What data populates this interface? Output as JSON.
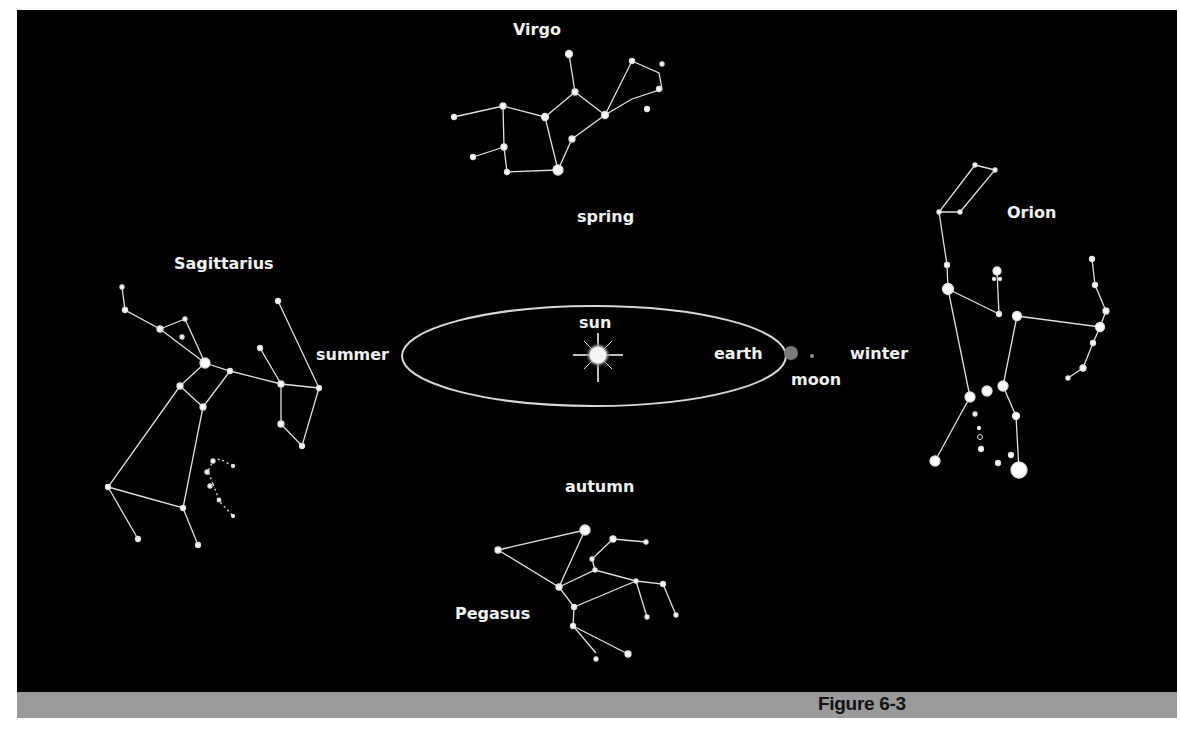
{
  "figure": {
    "caption": "Figure 6-3",
    "colors": {
      "background": "#000000",
      "caption_bar": "#9a9a9a",
      "caption_text": "#111111",
      "label_text": "#f2f2f2",
      "orbit_line": "#d8d8d8",
      "earth": "#7a7a7a",
      "moon": "#8a8a8a",
      "sun": "#ffffff"
    }
  },
  "orbit": {
    "sun_label": "sun",
    "earth_label": "earth",
    "moon_label": "moon"
  },
  "seasons": {
    "spring": "spring",
    "summer": "summer",
    "autumn": "autumn",
    "winter": "winter"
  },
  "constellations": {
    "virgo": {
      "name": "Virgo",
      "season_position": "spring"
    },
    "sagittarius": {
      "name": "Sagittarius",
      "season_position": "summer"
    },
    "pegasus": {
      "name": "Pegasus",
      "season_position": "autumn"
    },
    "orion": {
      "name": "Orion",
      "season_position": "winter"
    }
  }
}
